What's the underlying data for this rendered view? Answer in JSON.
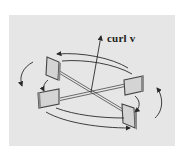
{
  "figure": {
    "label_text": "curl v",
    "colors": {
      "background": "#ffffff",
      "panel": "#e6e6e6",
      "ink": "#2a2a2a",
      "paddle_face": "#d4d4d4",
      "paddle_edge": "#444444"
    }
  }
}
